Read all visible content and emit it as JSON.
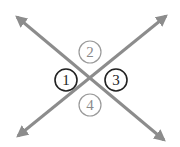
{
  "diagram": {
    "line_color": "#8c8c8c",
    "highlight_color": "#222222",
    "muted_color": "#9a9a9a",
    "lines": [
      {
        "id": "line-a",
        "from": [
          15,
          15
        ],
        "to": [
          166,
          142
        ],
        "arrows": "both"
      },
      {
        "id": "line-b",
        "from": [
          16,
          138
        ],
        "to": [
          168,
          14
        ],
        "arrows": "both"
      }
    ],
    "angles": [
      {
        "id": "1",
        "label": "1",
        "cx": 66,
        "cy": 80,
        "highlighted": true
      },
      {
        "id": "2",
        "label": "2",
        "cx": 90,
        "cy": 52,
        "highlighted": false
      },
      {
        "id": "3",
        "label": "3",
        "cx": 116,
        "cy": 80,
        "highlighted": true
      },
      {
        "id": "4",
        "label": "4",
        "cx": 90,
        "cy": 105,
        "highlighted": false
      }
    ]
  }
}
